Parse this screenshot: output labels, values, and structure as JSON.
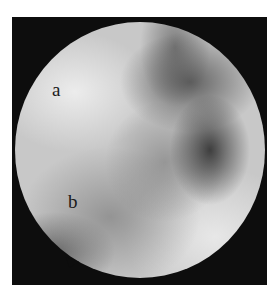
{
  "image": {
    "description": "Grayscale circular arthroscopic/endoscopic view on black background",
    "labels": [
      {
        "id": "a",
        "text": "a"
      },
      {
        "id": "b",
        "text": "b"
      }
    ],
    "colors": {
      "frame": "#0d0d0d",
      "background": "#ffffff",
      "label": "#1a1a1a"
    }
  }
}
